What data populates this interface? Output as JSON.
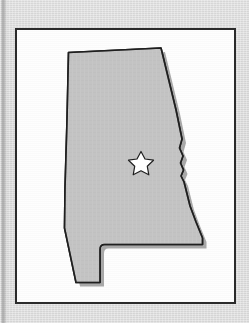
{
  "page": {
    "background_color": "#d9d9d9",
    "width": 249,
    "height": 323
  },
  "frame": {
    "border_color": "#2b2b2b",
    "fill_color": "#fdfdfd"
  },
  "map": {
    "subject": "Alabama",
    "shape_fill_color": "#c3c3c3",
    "shape_outline_color": "#1f1f1f",
    "shadow_color": "#a8a8a8",
    "watermark_text": "",
    "capital_marker": {
      "icon": "star-icon",
      "fill_color": "#ffffff",
      "outline_color": "#1f1f1f",
      "x": 141,
      "y": 161
    }
  }
}
